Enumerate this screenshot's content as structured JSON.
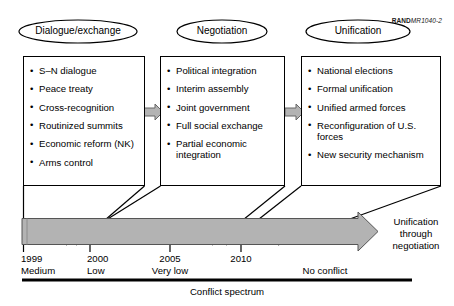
{
  "credit": {
    "brand": "RAND",
    "document": "MR1040-2"
  },
  "stages": [
    {
      "title": "Dialogue/exchange",
      "items": [
        "S–N dialogue",
        "Peace treaty",
        "Cross-recognition",
        "Routinized summits",
        "Economic reform (NK)",
        "Arms control"
      ]
    },
    {
      "title": "Negotiation",
      "items": [
        "Political integration",
        "Interim assembly",
        "Joint government",
        "Full social exchange",
        "Partial economic integration"
      ]
    },
    {
      "title": "Unification",
      "items": [
        "National elections",
        "Formal unification",
        "Unified armed forces",
        "Reconfiguration of U.S. forces",
        "New security mechanism"
      ]
    }
  ],
  "timeline": {
    "ticks": [
      {
        "year": "1999",
        "level": "Medium"
      },
      {
        "year": "2000",
        "level": "Low"
      },
      {
        "year": "2005",
        "level": "Very low"
      },
      {
        "year": "2010",
        "level": ""
      }
    ],
    "end_level": "No conflict",
    "arrow_caption_line1": "Unification",
    "arrow_caption_line2": "through",
    "arrow_caption_line3": "negotiation",
    "axis_caption": "Conflict spectrum"
  },
  "colors": {
    "band_fill": "#b3b3b3",
    "band_stroke": "#4d4d4d",
    "connector_arrow_fill": "#b3b3b3",
    "line": "#000000"
  }
}
